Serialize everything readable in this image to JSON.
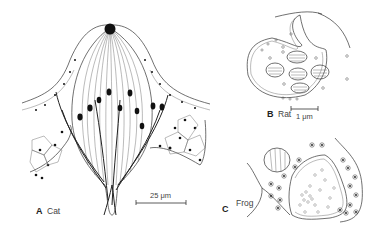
{
  "figure": {
    "panels": [
      {
        "letter": "A",
        "name": "Cat",
        "scale_label": "25 μm"
      },
      {
        "letter": "B",
        "name": "Rat",
        "scale_label": "1 μm"
      },
      {
        "letter": "C",
        "name": "Frog"
      }
    ]
  },
  "colors": {
    "line": "#333333",
    "nucleus": "#111111",
    "background": "#ffffff"
  }
}
